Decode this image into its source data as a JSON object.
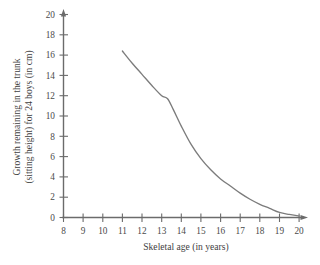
{
  "chart_data": {
    "type": "line",
    "title": "",
    "xlabel": "Skeletal age (in years)",
    "ylabel_line1": "Growth remaining in the trunk",
    "ylabel_line2": "(sitting height) for 24 boys (in cm)",
    "xlim": [
      8,
      20
    ],
    "ylim": [
      0,
      20
    ],
    "xticks": [
      8,
      9,
      10,
      11,
      12,
      13,
      14,
      15,
      16,
      17,
      18,
      19,
      20
    ],
    "yticks": [
      0,
      2,
      4,
      6,
      8,
      10,
      12,
      14,
      16,
      18,
      20
    ],
    "xtick_labels": [
      "8",
      "9",
      "10",
      "11",
      "12",
      "13",
      "14",
      "15",
      "16",
      "17",
      "18",
      "19",
      "20"
    ],
    "ytick_labels": [
      "0",
      "2",
      "4",
      "6",
      "8",
      "10",
      "12",
      "14",
      "16",
      "18",
      "20"
    ],
    "grid": false,
    "legend": null,
    "series": [
      {
        "name": "Growth remaining in the trunk",
        "color": "#7c7c7c",
        "x": [
          11.0,
          11.5,
          12.0,
          12.5,
          13.0,
          13.3,
          13.6,
          14.0,
          14.5,
          15.0,
          15.5,
          16.0,
          16.5,
          17.0,
          17.5,
          18.0,
          18.5,
          19.0,
          19.5,
          20.0
        ],
        "y": [
          16.4,
          15.2,
          14.1,
          13.0,
          12.0,
          11.7,
          10.6,
          9.0,
          7.2,
          5.8,
          4.7,
          3.8,
          3.1,
          2.4,
          1.8,
          1.3,
          0.9,
          0.5,
          0.3,
          0.15
        ]
      }
    ],
    "annotations": []
  },
  "axes": {
    "x_axis_name": "skeletal-age-axis",
    "y_axis_name": "growth-remaining-axis",
    "axis_color": "#6b6b6b"
  }
}
